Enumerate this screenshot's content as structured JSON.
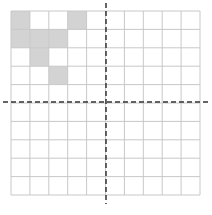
{
  "grid": {
    "rows": 10,
    "cols": 10,
    "left": 11,
    "top": 11,
    "width": 189,
    "height": 184,
    "line_color": "#c8c8c8",
    "fill_color": "#d3d3d3",
    "shaded_cells": [
      {
        "row": 0,
        "col": 0
      },
      {
        "row": 0,
        "col": 3
      },
      {
        "row": 1,
        "col": 0
      },
      {
        "row": 1,
        "col": 1
      },
      {
        "row": 1,
        "col": 2
      },
      {
        "row": 2,
        "col": 1
      },
      {
        "row": 3,
        "col": 2
      }
    ]
  },
  "axes": {
    "color": "#333333",
    "vertical": {
      "x": 106,
      "y1": 3,
      "y2": 204
    },
    "horizontal": {
      "y": 102,
      "x1": 3,
      "x2": 209
    }
  }
}
